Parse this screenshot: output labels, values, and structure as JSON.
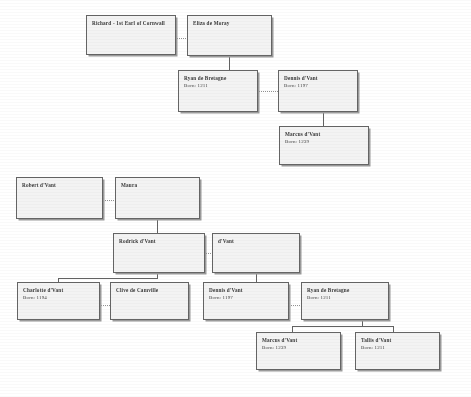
{
  "document": {
    "type": "family-tree-diagram",
    "title": "Family Tree"
  },
  "labels": {
    "born_prefix": "Born:"
  },
  "trees": [
    {
      "id": "tree-cornwall",
      "nodes": [
        {
          "id": "richard-cornwall",
          "name": "Richard - 1st Earl of Cornwall",
          "born": ""
        },
        {
          "id": "eliza-de-moray",
          "name": "Eliza de Moray",
          "born": ""
        },
        {
          "id": "ryan-de-bretagne-1",
          "name": "Ryan de Bretagne",
          "born": "Born: 1211"
        },
        {
          "id": "dennis-dvant-1",
          "name": "Dennis d'Vant",
          "born": "Born: 1197"
        },
        {
          "id": "marcus-dvant-1",
          "name": "Marcus d'Vant",
          "born": "Born: 1239"
        }
      ]
    },
    {
      "id": "tree-dvant",
      "nodes": [
        {
          "id": "robert-dvant",
          "name": "Robert d'Vant",
          "born": ""
        },
        {
          "id": "maura",
          "name": "Maura",
          "born": ""
        },
        {
          "id": "rodrick-dvant",
          "name": "Rodrick d'Vant",
          "born": ""
        },
        {
          "id": "dvant",
          "name": "d'Vant",
          "born": ""
        },
        {
          "id": "charlotte-dvant",
          "name": "Charlotte d'Vant",
          "born": "Born: 1194"
        },
        {
          "id": "clive-de-camville",
          "name": "Clive de Camville",
          "born": ""
        },
        {
          "id": "dennis-dvant-2",
          "name": "Dennis d'Vant",
          "born": "Born: 1197"
        },
        {
          "id": "ryan-de-bretagne-2",
          "name": "Ryan de Bretagne",
          "born": "Born: 1211"
        },
        {
          "id": "marcus-dvant-2",
          "name": "Marcus d'Vant",
          "born": "Born: 1239"
        },
        {
          "id": "tallis-dvant",
          "name": "Tallis d'Vant",
          "born": "Born: 1211"
        }
      ]
    }
  ]
}
